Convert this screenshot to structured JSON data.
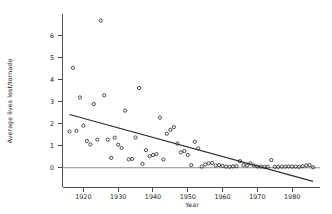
{
  "chart_data": {
    "type": "scatter",
    "title": "",
    "xlabel": "Year",
    "ylabel": "Average lives lost/tornado",
    "xlim": [
      1914,
      1988
    ],
    "ylim": [
      -0.9,
      7.0
    ],
    "grid": false,
    "legend": null,
    "xticks": [
      1920,
      1930,
      1940,
      1950,
      1960,
      1970,
      1980
    ],
    "xtick_labels": [
      "1920",
      "1930",
      "1940",
      "1950",
      "1960",
      "1970",
      "1980"
    ],
    "yticks": [
      0,
      1,
      2,
      3,
      4,
      5,
      6
    ],
    "ytick_labels": [
      "0",
      "1",
      "2",
      "3",
      "4",
      "5",
      "6"
    ],
    "marker": "open-circle",
    "marker_color": "#2b2b2b",
    "x": [
      1916,
      1917,
      1918,
      1919,
      1920,
      1921,
      1922,
      1923,
      1924,
      1925,
      1926,
      1927,
      1928,
      1929,
      1930,
      1931,
      1932,
      1933,
      1934,
      1935,
      1936,
      1937,
      1938,
      1939,
      1940,
      1941,
      1942,
      1943,
      1944,
      1945,
      1946,
      1947,
      1948,
      1949,
      1950,
      1951,
      1952,
      1953,
      1954,
      1955,
      1956,
      1957,
      1958,
      1959,
      1960,
      1961,
      1962,
      1963,
      1964,
      1965,
      1966,
      1967,
      1968,
      1969,
      1970,
      1971,
      1972,
      1973,
      1974,
      1975,
      1976,
      1977,
      1978,
      1979,
      1980,
      1981,
      1982,
      1983,
      1984,
      1985,
      1986
    ],
    "y": [
      1.65,
      4.55,
      1.68,
      3.2,
      1.92,
      1.22,
      1.06,
      2.9,
      1.28,
      6.7,
      3.3,
      1.28,
      0.45,
      1.37,
      1.05,
      0.9,
      2.6,
      0.38,
      0.4,
      1.38,
      3.63,
      0.18,
      0.8,
      0.52,
      0.58,
      0.62,
      2.28,
      0.37,
      1.55,
      1.72,
      1.85,
      1.1,
      0.7,
      0.76,
      0.58,
      0.12,
      1.18,
      0.88,
      0.05,
      0.15,
      0.2,
      0.22,
      0.1,
      0.12,
      0.08,
      0.05,
      0.04,
      0.06,
      0.07,
      0.3,
      0.12,
      0.1,
      0.2,
      0.1,
      0.06,
      0.05,
      0.04,
      0.05,
      0.35,
      0.04,
      0.04,
      0.05,
      0.05,
      0.06,
      0.05,
      0.05,
      0.04,
      0.07,
      0.1,
      0.12,
      0.02
    ],
    "fit_line": {
      "name": "linear regression",
      "x": [
        1916,
        1986
      ],
      "y": [
        2.42,
        -0.62
      ],
      "color": "#2b2b2b"
    },
    "reference_line": {
      "name": "zero line",
      "y": 0,
      "color": "#8a8a8a"
    }
  }
}
